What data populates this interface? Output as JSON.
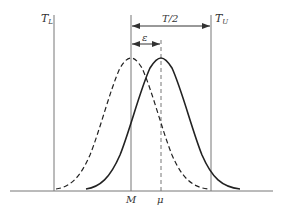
{
  "diagram": {
    "title": "",
    "labels": {
      "lower_limit": "T",
      "lower_limit_sub": "L",
      "upper_limit": "T",
      "upper_limit_sub": "U",
      "half_tolerance": "T/2",
      "offset": "ε",
      "center": "M",
      "mean": "μ"
    },
    "curves": [
      {
        "name": "nominal-distribution",
        "style": "dashed",
        "center": "M"
      },
      {
        "name": "shifted-distribution",
        "style": "solid",
        "center": "μ"
      }
    ],
    "colors": {
      "line": "#555555",
      "curve": "#222222",
      "text": "#333333"
    }
  }
}
